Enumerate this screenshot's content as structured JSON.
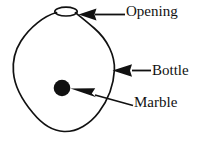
{
  "figure": {
    "background_color": "#ffffff",
    "stroke_color": "#111111",
    "fill_color": "#111111"
  },
  "labels": {
    "opening": "Opening",
    "bottle": "Bottle",
    "marble": "Marble"
  },
  "parts": {
    "bottle_outline": "bottle-outline",
    "opening_ellipse": "opening-ellipse",
    "marble_circle": "marble-circle"
  },
  "annotations": [
    {
      "label": "Opening",
      "icon": "arrow-left-icon",
      "points_to": "opening-ellipse"
    },
    {
      "label": "Bottle",
      "icon": "arrow-left-icon",
      "points_to": "bottle-outline"
    },
    {
      "label": "Marble",
      "icon": "arrow-up-left-icon",
      "points_to": "marble-circle"
    }
  ]
}
